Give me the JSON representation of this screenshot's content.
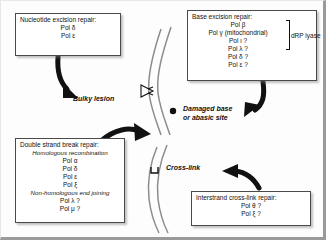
{
  "diagram": {
    "type": "pathway-diagram",
    "background_color": "#fdfdfd",
    "arrow_color": "#111111",
    "dna_strand_color": "#8c8c8c"
  },
  "boxes": {
    "nucleotide_excision_repair": {
      "title": "Nucleotide excision repair:",
      "items": [
        "Pol δ",
        "Pol ε"
      ]
    },
    "base_excision_repair": {
      "title": "Base excision repair:",
      "items": [
        "Pol β",
        "Pol γ (mitochondrial)",
        "Pol ι ?",
        "Pol λ ?",
        "Pol δ ?",
        "Pol ε ?"
      ],
      "bracket_label": "dRP lyase"
    },
    "double_strand_break_repair": {
      "title": "Double strand break repair:",
      "subheading_1": "Homologous recombination",
      "items_1": [
        "Pol α",
        "Pol δ",
        "Pol ε",
        "Pol ξ"
      ],
      "subheading_2": "Non-homologous end joining",
      "items_2": [
        "Pol λ ?",
        "Pol μ ?"
      ]
    },
    "interstrand_crosslink_repair": {
      "title": "Interstrand cross-link repair:",
      "items": [
        "Pol θ ?",
        "Pol ξ ?"
      ]
    }
  },
  "lesion_labels": {
    "bulky_lesion": "Bulky lesion",
    "damaged_base_line1": "Damaged base",
    "damaged_base_line2": "or abasic site",
    "cross_link": "Cross-link"
  },
  "icons": {
    "bulky_lesion_marker": "wedge-lesion-icon",
    "damaged_base_marker": "dot-lesion-icon",
    "crosslink_marker": "bracket-crosslink-icon",
    "dna": "dna-double-strand-icon"
  }
}
